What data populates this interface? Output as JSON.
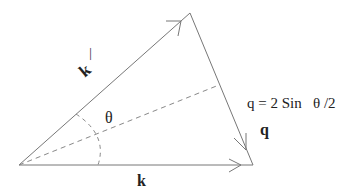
{
  "diagram": {
    "labels": {
      "k_prime": "k",
      "k_prime_mark": "—",
      "k": "k",
      "q": "q",
      "theta": "θ",
      "formula": "q = 2 Sin   θ /2"
    },
    "vertices": {
      "origin": [
        19,
        165
      ],
      "top": [
        190,
        13
      ],
      "right": [
        253,
        165
      ]
    },
    "colors": {
      "line": "#777777",
      "dash": "#888888",
      "text": "#222222"
    }
  }
}
